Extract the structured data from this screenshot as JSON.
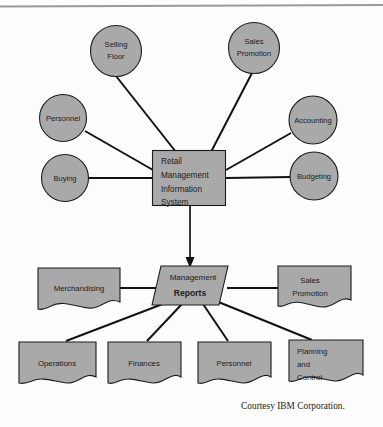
{
  "figure": {
    "caption": "Courtesy IBM Corporation.",
    "colors": {
      "shape_fill": "#a9a9a9",
      "shape_stroke": "#1c1c1c",
      "connector": "#121212",
      "background": "#fdfdfd",
      "rule": "#9a9a9a"
    }
  },
  "core": {
    "name": "retail-management-information-system",
    "lines": [
      "Retail",
      "Management",
      "Information",
      "System"
    ]
  },
  "inputs": [
    {
      "name": "selling-floor",
      "lines": [
        "Selling",
        "Floor"
      ]
    },
    {
      "name": "sales-promotion",
      "lines": [
        "Sales",
        "Promotion"
      ]
    },
    {
      "name": "personnel",
      "lines": [
        "Personnel"
      ]
    },
    {
      "name": "accounting",
      "lines": [
        "Accounting"
      ]
    },
    {
      "name": "buying",
      "lines": [
        "Buying"
      ]
    },
    {
      "name": "budgeting",
      "lines": [
        "Budgeting"
      ]
    }
  ],
  "reports": {
    "name": "management-reports",
    "line_top": "Management",
    "line_bold": "Reports"
  },
  "outputs": [
    {
      "name": "merchandising",
      "lines": [
        "Merchandising"
      ]
    },
    {
      "name": "sales-promotion-out",
      "lines": [
        "Sales",
        "Promotion"
      ]
    },
    {
      "name": "operations",
      "lines": [
        "Operations"
      ]
    },
    {
      "name": "finances",
      "lines": [
        "Finances"
      ]
    },
    {
      "name": "personnel-out",
      "lines": [
        "Personnel"
      ]
    },
    {
      "name": "planning-and-control",
      "lines": [
        "Planning",
        "and",
        "Control"
      ]
    }
  ]
}
